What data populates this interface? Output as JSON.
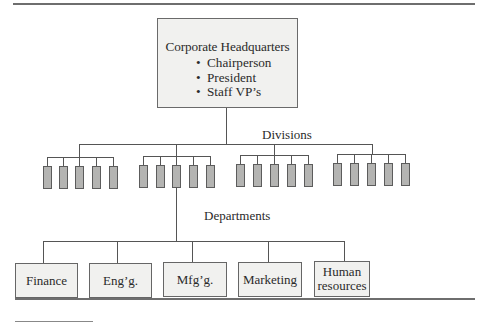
{
  "diagram": {
    "headquarters": {
      "title": "Corporate Headquarters",
      "members": [
        "Chairperson",
        "President",
        "Staff VP’s"
      ],
      "bullet": "•"
    },
    "divisions_label": "Divisions",
    "division_groups": 4,
    "units_per_division": 5,
    "departments_label": "Departments",
    "departments": [
      "Finance",
      "Eng’g.",
      "Mfg’g.",
      "Marketing",
      "Human resources"
    ],
    "colors": {
      "box_fill": "#f1f1ef",
      "division_unit_fill": "#b4b4b2",
      "line": "#555555"
    }
  }
}
